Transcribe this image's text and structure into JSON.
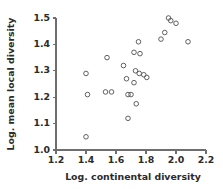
{
  "chart_data": {
    "type": "scatter",
    "title": "",
    "xlabel": "Log. continental diversity",
    "ylabel": "Log. mean local diversity",
    "xlim": [
      1.2,
      2.2
    ],
    "ylim": [
      1.0,
      1.5
    ],
    "xticks": [
      "1.2",
      "1.4",
      "1.6",
      "1.8",
      "2.0",
      "2.2"
    ],
    "xtick_values": [
      1.2,
      1.4,
      1.6,
      1.8,
      2.0,
      2.2
    ],
    "yticks": [
      "1.0",
      "1.1",
      "1.2",
      "1.3",
      "1.4",
      "1.5"
    ],
    "ytick_values": [
      1.0,
      1.1,
      1.2,
      1.3,
      1.4,
      1.5
    ],
    "grid": false,
    "legend": false,
    "marker": "open-circle",
    "marker_color": "#595959",
    "marker_size": 4.6,
    "n_points": 26,
    "points": [
      {
        "x": 1.4,
        "y": 1.29
      },
      {
        "x": 1.41,
        "y": 1.21
      },
      {
        "x": 1.4,
        "y": 1.05
      },
      {
        "x": 1.53,
        "y": 1.22
      },
      {
        "x": 1.57,
        "y": 1.22
      },
      {
        "x": 1.54,
        "y": 1.35
      },
      {
        "x": 1.65,
        "y": 1.32
      },
      {
        "x": 1.67,
        "y": 1.27
      },
      {
        "x": 1.68,
        "y": 1.21
      },
      {
        "x": 1.7,
        "y": 1.21
      },
      {
        "x": 1.72,
        "y": 1.37
      },
      {
        "x": 1.75,
        "y": 1.41
      },
      {
        "x": 1.76,
        "y": 1.365
      },
      {
        "x": 1.73,
        "y": 1.3
      },
      {
        "x": 1.755,
        "y": 1.29
      },
      {
        "x": 1.785,
        "y": 1.285
      },
      {
        "x": 1.805,
        "y": 1.275
      },
      {
        "x": 1.72,
        "y": 1.255
      },
      {
        "x": 1.735,
        "y": 1.175
      },
      {
        "x": 1.68,
        "y": 1.12
      },
      {
        "x": 1.9,
        "y": 1.42
      },
      {
        "x": 1.925,
        "y": 1.445
      },
      {
        "x": 1.95,
        "y": 1.5
      },
      {
        "x": 1.965,
        "y": 1.49
      },
      {
        "x": 2.0,
        "y": 1.48
      },
      {
        "x": 2.08,
        "y": 1.41
      }
    ]
  }
}
